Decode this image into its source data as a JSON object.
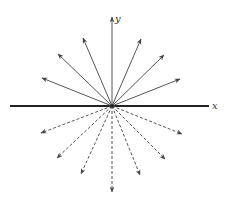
{
  "diagram": {
    "origin": [
      112,
      106
    ],
    "axes": {
      "x_label": "x",
      "y_label": "y",
      "x_axis": {
        "from": [
          10,
          106
        ],
        "to": [
          209,
          106
        ]
      },
      "y_axis": {
        "from": [
          112,
          106
        ],
        "to": [
          112,
          17
        ]
      }
    },
    "solid_rays": [
      {
        "to": [
          42,
          78
        ]
      },
      {
        "to": [
          58,
          54
        ]
      },
      {
        "to": [
          83,
          38
        ]
      },
      {
        "to": [
          141,
          39
        ]
      },
      {
        "to": [
          164,
          55
        ]
      },
      {
        "to": [
          180,
          79
        ]
      }
    ],
    "dashed_rays": [
      {
        "to": [
          41,
          133
        ]
      },
      {
        "to": [
          57,
          158
        ]
      },
      {
        "to": [
          81,
          174
        ]
      },
      {
        "to": [
          112,
          192
        ]
      },
      {
        "to": [
          140,
          175
        ]
      },
      {
        "to": [
          165,
          159
        ]
      },
      {
        "to": [
          182,
          134
        ]
      }
    ],
    "colors": {
      "ray": "#555555",
      "axis": "#222222",
      "background": "#ffffff"
    }
  }
}
